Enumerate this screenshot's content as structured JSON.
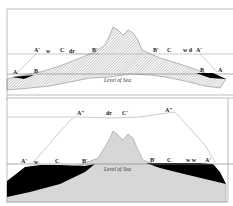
{
  "figure": {
    "sea_level_label": "Level of Sea",
    "colors": {
      "ice": "#000000",
      "rock_hatch": "#9a9a9a",
      "frame": "#bdbdbd",
      "background": "#ffffff"
    }
  },
  "top_panel": {
    "labels": {
      "left_A": "A",
      "left_B": "B",
      "left_A_prime": "A'",
      "left_w": "w",
      "left_C": "C",
      "left_dr": "dr",
      "left_B_prime": "B'",
      "right_B_prime": "B'",
      "right_C": "C",
      "right_marks": "w d",
      "right_A_prime": "A'",
      "right_B": "B",
      "right_A": "A"
    },
    "sea_level_label": "Level of Sea"
  },
  "bottom_panel": {
    "labels": {
      "upper_A_left": "A\"",
      "upper_dr": "dr",
      "upper_C": "C'",
      "upper_A_right": "A\"",
      "left_A_prime": "A'",
      "left_w": "w",
      "left_C": "C",
      "left_B_prime": "B'",
      "right_B_prime": "B'",
      "right_C": "C",
      "right_marks": "w w",
      "right_A_prime": "A'"
    },
    "sea_level_label": "Level of Sea"
  }
}
